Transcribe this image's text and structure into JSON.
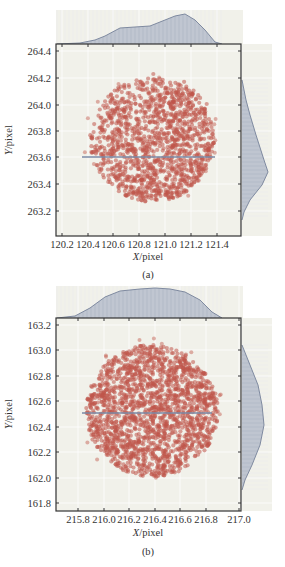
{
  "colors": {
    "panel_bg": "#f1f1ea",
    "grid": "#ffffff",
    "frame": "#333333",
    "point": "#c0564a",
    "hist_fill": "#b9c0cc",
    "hist_line": "#7f8aa0",
    "mean_line": "#7a8aa6"
  },
  "chart_data": [
    {
      "type": "scatter",
      "caption": "(a)",
      "xlabel": "X/pixel",
      "ylabel": "Y/pixel",
      "xticks": [
        "120.2",
        "120.4",
        "120.6",
        "120.8",
        "121.0",
        "121.2",
        "121.4"
      ],
      "yticks": [
        "264.4",
        "264.2",
        "264.0",
        "263.8",
        "263.6",
        "263.4",
        "263.2"
      ],
      "xlim": [
        120.16,
        121.6
      ],
      "ylim": [
        263.02,
        264.46
      ],
      "grid": true,
      "marginal_histograms": [
        "top (X)",
        "right (Y)"
      ],
      "scatter_cloud": {
        "center_x": 120.9,
        "center_y": 263.7,
        "radius_x": 0.47,
        "radius_y": 0.47,
        "density_skew": "denser toward lower-right",
        "n_points": 1600
      },
      "mean_line_y": 263.61,
      "mean_line_x_range": [
        120.35,
        121.38
      ],
      "x_density_peak": 121.0,
      "y_density_peak": 263.45
    },
    {
      "type": "scatter",
      "caption": "(b)",
      "xlabel": "X/pixel",
      "ylabel": "Y/pixel",
      "xticks": [
        "215.8",
        "216.0",
        "216.2",
        "216.4",
        "216.6",
        "216.8",
        "217.0"
      ],
      "yticks": [
        "163.2",
        "163.0",
        "162.8",
        "162.6",
        "162.4",
        "162.2",
        "162.0",
        "161.8"
      ],
      "xlim": [
        215.62,
        217.04
      ],
      "ylim": [
        161.74,
        163.26
      ],
      "grid": true,
      "marginal_histograms": [
        "top (X)",
        "right (Y)"
      ],
      "scatter_cloud": {
        "center_x": 216.4,
        "center_y": 162.5,
        "radius_x": 0.5,
        "radius_y": 0.5,
        "density_skew": "uniform disc",
        "n_points": 1800
      },
      "mean_line_y": 162.5,
      "mean_line_x_range": [
        215.8,
        216.82
      ],
      "x_density_peak": 216.4,
      "y_density_peak": 162.4
    }
  ],
  "panels": [
    {
      "frame": {
        "x": 56,
        "y": 44,
        "w": 185,
        "h": 192
      },
      "top_hist": {
        "x": 56,
        "y": 10,
        "w": 187,
        "h": 34
      },
      "right_hist": {
        "x": 242,
        "y": 44,
        "w": 30,
        "h": 192
      },
      "xtick_px": [
        62,
        88,
        113,
        139,
        165,
        191,
        217
      ],
      "ytick_px": [
        51,
        78,
        105,
        131,
        157,
        184,
        211
      ],
      "cloud_px": {
        "cx": 152,
        "cy": 140,
        "r": 62,
        "skew": 1
      },
      "mean_px": {
        "y": 157,
        "x1": 82,
        "x2": 215
      },
      "top_curve": [
        [
          57,
          44
        ],
        [
          80,
          43
        ],
        [
          95,
          40
        ],
        [
          105,
          36
        ],
        [
          120,
          28
        ],
        [
          135,
          27
        ],
        [
          150,
          26
        ],
        [
          160,
          22
        ],
        [
          175,
          16
        ],
        [
          185,
          14
        ],
        [
          195,
          20
        ],
        [
          205,
          30
        ],
        [
          215,
          42
        ],
        [
          222,
          44
        ]
      ],
      "right_curve": [
        [
          242,
          80
        ],
        [
          246,
          100
        ],
        [
          250,
          115
        ],
        [
          256,
          135
        ],
        [
          264,
          160
        ],
        [
          268,
          172
        ],
        [
          262,
          185
        ],
        [
          250,
          200
        ],
        [
          244,
          212
        ],
        [
          242,
          220
        ]
      ],
      "xlabel_pos": {
        "x": 148,
        "y": 260
      },
      "ylabel_pos": {
        "x": 12,
        "y": 140
      },
      "caption_pos": {
        "x": 148,
        "y": 278
      },
      "seed": 7
    },
    {
      "frame": {
        "x": 56,
        "y": 318,
        "w": 185,
        "h": 193
      },
      "top_hist": {
        "x": 56,
        "y": 286,
        "w": 187,
        "h": 32
      },
      "right_hist": {
        "x": 242,
        "y": 318,
        "w": 30,
        "h": 193
      },
      "xtick_px": [
        78,
        104,
        129,
        155,
        180,
        206,
        239
      ],
      "ytick_px": [
        325,
        350,
        376,
        401,
        427,
        452,
        478,
        503
      ],
      "cloud_px": {
        "cx": 152,
        "cy": 411,
        "r": 66,
        "skew": 0
      },
      "mean_px": {
        "y": 413,
        "x1": 82,
        "x2": 212
      },
      "top_curve": [
        [
          57,
          318
        ],
        [
          75,
          316
        ],
        [
          90,
          308
        ],
        [
          105,
          297
        ],
        [
          120,
          291
        ],
        [
          140,
          289
        ],
        [
          155,
          288
        ],
        [
          170,
          289
        ],
        [
          185,
          292
        ],
        [
          200,
          300
        ],
        [
          212,
          312
        ],
        [
          222,
          318
        ]
      ],
      "right_curve": [
        [
          242,
          345
        ],
        [
          250,
          365
        ],
        [
          258,
          385
        ],
        [
          262,
          405
        ],
        [
          264,
          425
        ],
        [
          260,
          445
        ],
        [
          252,
          465
        ],
        [
          245,
          480
        ],
        [
          242,
          490
        ]
      ],
      "xlabel_pos": {
        "x": 148,
        "y": 536
      },
      "ylabel_pos": {
        "x": 12,
        "y": 414
      },
      "caption_pos": {
        "x": 148,
        "y": 555
      },
      "seed": 13
    }
  ]
}
